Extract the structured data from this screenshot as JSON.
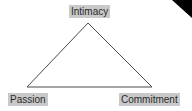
{
  "diagram": {
    "vertices": [
      {
        "id": "top",
        "label": "Intimacy"
      },
      {
        "id": "bottom-left",
        "label": "Passion"
      },
      {
        "id": "bottom-right",
        "label": "Commitment"
      }
    ]
  },
  "colors": {
    "line": "#4a4a4a",
    "label_bg": "#c9c9c9",
    "corner": "#000000"
  }
}
